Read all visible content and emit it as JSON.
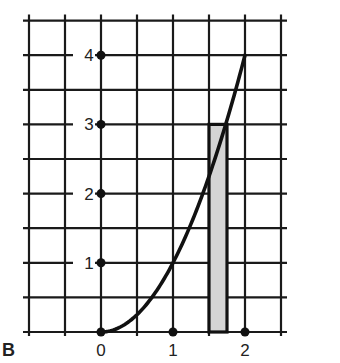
{
  "panel_label": "B",
  "colors": {
    "grid": "#1a1a1a",
    "curve": "#111111",
    "bar_fill": "#d4d4d4",
    "bar_stroke": "#111111",
    "background": "#ffffff"
  },
  "chart_data": {
    "type": "line",
    "title": "",
    "xlabel": "",
    "ylabel": "",
    "xlim": [
      -1,
      2.5
    ],
    "ylim": [
      0,
      4.5
    ],
    "grid": true,
    "x_ticks": [
      0,
      1,
      2
    ],
    "y_ticks": [
      1,
      2,
      3,
      4
    ],
    "x_tick_labels": [
      "0",
      "1",
      "2"
    ],
    "y_tick_labels": [
      "1",
      "2",
      "3",
      "4"
    ],
    "series": [
      {
        "name": "curve y = x^2",
        "x": [
          0,
          0.25,
          0.5,
          0.75,
          1.0,
          1.25,
          1.5,
          1.75,
          2.0
        ],
        "y": [
          0,
          0.0625,
          0.25,
          0.5625,
          1.0,
          1.5625,
          2.25,
          3.0625,
          4.0
        ]
      }
    ],
    "annotations": [
      {
        "type": "rectangle",
        "description": "shaded bar",
        "x_start": 1.5,
        "x_end": 1.75,
        "height": 3
      }
    ],
    "grid_spacing": {
      "x": 0.5,
      "y": 0.5
    }
  }
}
